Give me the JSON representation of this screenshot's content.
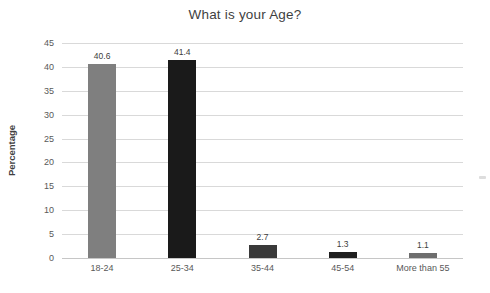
{
  "chart_data": {
    "type": "bar",
    "title": "What is your Age?",
    "categories": [
      "18-24",
      "25-34",
      "35-44",
      "45-54",
      "More than 55"
    ],
    "values": [
      40.6,
      41.4,
      2.7,
      1.3,
      1.1
    ],
    "data_labels": [
      "40.6",
      "41.4",
      "2.7",
      "1.3",
      "1.1"
    ],
    "bar_colors": [
      "#7f7f7f",
      "#1a1a1a",
      "#3a3a3a",
      "#1f1f1f",
      "#6e6e6e"
    ],
    "xlabel": "",
    "ylabel": "Percentage",
    "ylim": [
      0,
      45
    ],
    "yticks": [
      0,
      5,
      10,
      15,
      20,
      25,
      30,
      35,
      40,
      45
    ],
    "grid": true,
    "legend": false
  },
  "colors": {
    "background": "#ffffff",
    "gridline": "#d9d9d9",
    "axis_line": "#c6c6c6",
    "title_text": "#3f3f3f",
    "tick_text": "#595959",
    "label_text": "#404040"
  }
}
